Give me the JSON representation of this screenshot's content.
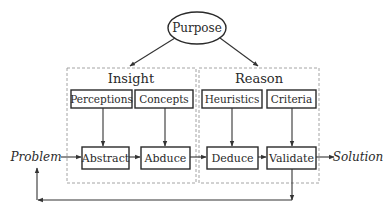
{
  "diagram": {
    "root": {
      "label": "Purpose"
    },
    "groups": [
      {
        "title": "Insight",
        "inputs": [
          "Perceptions",
          "Concepts"
        ],
        "steps": [
          "Abstract",
          "Abduce"
        ]
      },
      {
        "title": "Reason",
        "inputs": [
          "Heuristics",
          "Criteria"
        ],
        "steps": [
          "Deduce",
          "Validate"
        ]
      }
    ],
    "start": "Problem",
    "end": "Solution",
    "edges": [
      {
        "from": "Purpose",
        "to": "Insight"
      },
      {
        "from": "Purpose",
        "to": "Reason"
      },
      {
        "from": "Perceptions",
        "to": "Abstract"
      },
      {
        "from": "Concepts",
        "to": "Abduce"
      },
      {
        "from": "Heuristics",
        "to": "Deduce"
      },
      {
        "from": "Criteria",
        "to": "Validate"
      },
      {
        "from": "Problem",
        "to": "Abstract"
      },
      {
        "from": "Abstract",
        "to": "Abduce"
      },
      {
        "from": "Abduce",
        "to": "Deduce"
      },
      {
        "from": "Deduce",
        "to": "Validate"
      },
      {
        "from": "Validate",
        "to": "Solution"
      },
      {
        "from": "Validate",
        "to": "Problem",
        "type": "feedback"
      }
    ]
  },
  "colors": {
    "stroke": "#2a2a2a",
    "dashed_border": "#9a9a9a",
    "background": "#ffffff"
  }
}
